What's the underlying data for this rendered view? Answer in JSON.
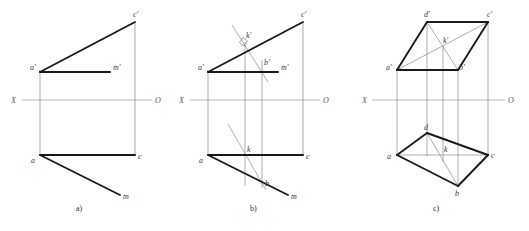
{
  "figure": {
    "background_color": "#ffffff",
    "thick_line_color": "#1a1a1a",
    "thin_line_color": "#8a8a8a",
    "axis_line_color": "#9a9a9a",
    "label_color": "#3a3a3a",
    "axis_label_color": "#555555",
    "thick_width": "1.9",
    "thin_width": "0.6",
    "axis_width": "0.7",
    "axis_y": 100
  },
  "captions": {
    "a": "a)",
    "b": "b)",
    "c": "c)"
  },
  "axis": {
    "left_label": "X",
    "right_label": "O"
  },
  "panel_a": {
    "caption": "a)",
    "axis_left_label": "X",
    "axis_right_label": "O",
    "points": {
      "a_prime": {
        "label": "a'",
        "x": 40,
        "y": 72
      },
      "c_prime": {
        "label": "c'",
        "x": 135,
        "y": 22
      },
      "m_prime": {
        "label": "m'",
        "x": 110,
        "y": 72
      },
      "a": {
        "label": "a",
        "x": 40,
        "y": 155
      },
      "c": {
        "label": "c",
        "x": 135,
        "y": 155
      },
      "m": {
        "label": "m",
        "x": 120,
        "y": 195
      }
    },
    "thick_edges": [
      {
        "name": "a'-c'",
        "from": "a_prime",
        "to": "c_prime"
      },
      {
        "name": "a'-m'",
        "from": "a_prime",
        "to": "m_prime"
      },
      {
        "name": "a-c",
        "from": "a",
        "to": "c"
      },
      {
        "name": "a-m",
        "from": "a",
        "to": "m"
      }
    ],
    "thin_projection_lines": [
      {
        "name": "vertical-through-a",
        "x": 40,
        "y1": 72,
        "y2": 155
      },
      {
        "name": "vertical-through-c",
        "x": 135,
        "y1": 22,
        "y2": 155
      }
    ]
  },
  "panel_b": {
    "caption": "b)",
    "axis_left_label": "X",
    "axis_right_label": "O",
    "points": {
      "a_prime": {
        "label": "a'",
        "x": 208,
        "y": 72
      },
      "c_prime": {
        "label": "c'",
        "x": 303,
        "y": 22
      },
      "m_prime": {
        "label": "m'",
        "x": 278,
        "y": 72
      },
      "b_prime": {
        "label": "b'",
        "x": 262,
        "y": 67
      },
      "k_prime": {
        "label": "k'",
        "x": 245,
        "y": 42
      },
      "a": {
        "label": "a",
        "x": 208,
        "y": 155
      },
      "c": {
        "label": "c",
        "x": 303,
        "y": 155
      },
      "m": {
        "label": "m",
        "x": 288,
        "y": 195
      },
      "b": {
        "label": "b",
        "x": 262,
        "y": 186
      },
      "k": {
        "label": "k",
        "x": 245,
        "y": 155
      }
    },
    "thick_edges": [
      {
        "name": "a'-c'",
        "from": "a_prime",
        "to": "c_prime"
      },
      {
        "name": "a'-m'",
        "from": "a_prime",
        "to": "m_prime"
      },
      {
        "name": "a-c",
        "from": "a",
        "to": "c"
      },
      {
        "name": "a-m",
        "from": "a",
        "to": "m"
      }
    ],
    "thin_lines": [
      {
        "name": "perpendicular-through-k-prime",
        "x1": 232,
        "y1": 25,
        "x2": 268,
        "y2": 80
      },
      {
        "name": "oblique-lower-through-k",
        "x1": 228,
        "y1": 125,
        "x2": 264,
        "y2": 188
      },
      {
        "name": "vertical-through-a",
        "x": 208,
        "y1": 72,
        "y2": 155
      },
      {
        "name": "vertical-through-c",
        "x": 303,
        "y1": 22,
        "y2": 155
      },
      {
        "name": "vertical-k-prime-to-k",
        "x": 245,
        "y1": 42,
        "y2": 186
      },
      {
        "name": "vertical-b-prime-to-b",
        "x": 262,
        "y1": 60,
        "y2": 188
      }
    ],
    "right_angle_marker": {
      "name": "right-angle-at-k-prime",
      "x": 245,
      "y": 42
    }
  },
  "panel_c": {
    "caption": "c)",
    "axis_left_label": "X",
    "axis_right_label": "O",
    "points": {
      "d_prime": {
        "label": "d'",
        "x": 427,
        "y": 22
      },
      "c_prime": {
        "label": "c'",
        "x": 488,
        "y": 22
      },
      "a_prime": {
        "label": "a'",
        "x": 397,
        "y": 70
      },
      "b_prime": {
        "label": "b'",
        "x": 458,
        "y": 70
      },
      "k_prime": {
        "label": "k'",
        "x": 443,
        "y": 46
      },
      "d": {
        "label": "d",
        "x": 427,
        "y": 133
      },
      "c": {
        "label": "c",
        "x": 488,
        "y": 155
      },
      "a": {
        "label": "a",
        "x": 397,
        "y": 155
      },
      "b": {
        "label": "b",
        "x": 458,
        "y": 186
      },
      "k": {
        "label": "k",
        "x": 443,
        "y": 155
      }
    },
    "upper_quad": {
      "name": "upper-parallelogram-a'd'c'b'",
      "vertices": [
        "a_prime",
        "d_prime",
        "c_prime",
        "b_prime"
      ]
    },
    "lower_quad": {
      "name": "lower-parallelogram-adcb",
      "vertices": [
        "a",
        "d",
        "c",
        "b"
      ]
    },
    "upper_diagonals": [
      {
        "name": "diagonal-a'-c'",
        "from": "a_prime",
        "to": "c_prime"
      },
      {
        "name": "diagonal-d'-b'",
        "from": "d_prime",
        "to": "b_prime"
      }
    ],
    "lower_diagonals": [
      {
        "name": "diagonal-a-c",
        "from": "a",
        "to": "c"
      },
      {
        "name": "diagonal-d-b",
        "from": "d",
        "to": "b"
      }
    ],
    "thin_projection_lines": [
      {
        "name": "vertical-through-a",
        "x": 397,
        "y1": 70,
        "y2": 155
      },
      {
        "name": "vertical-through-d",
        "x": 427,
        "y1": 22,
        "y2": 155
      },
      {
        "name": "vertical-through-b",
        "x": 458,
        "y1": 70,
        "y2": 186
      },
      {
        "name": "vertical-through-c",
        "x": 488,
        "y1": 22,
        "y2": 155
      },
      {
        "name": "vertical-through-k",
        "x": 443,
        "y1": 46,
        "y2": 160
      }
    ]
  }
}
